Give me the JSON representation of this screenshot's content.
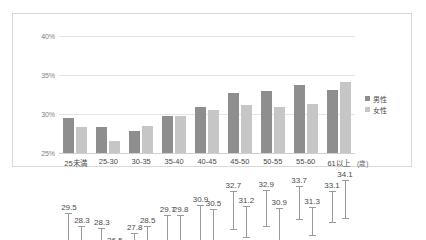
{
  "chart_data": {
    "type": "bar",
    "title": "",
    "subtitle": "",
    "xlabel": "(歳)",
    "ylabel": "",
    "ylim": [
      25,
      40
    ],
    "yticks": [
      40,
      35,
      30,
      25
    ],
    "ytick_labels": [
      "40%",
      "35%",
      "30%",
      "25%"
    ],
    "grid": true,
    "legend_position": "right",
    "categories": [
      "25未満",
      "25-30",
      "30-35",
      "35-40",
      "40-45",
      "45-50",
      "50-55",
      "55-60",
      "61以上"
    ],
    "series": [
      {
        "name": "男性",
        "color": "#8e8e8e",
        "values": [
          29.5,
          28.3,
          27.8,
          29.7,
          30.9,
          32.7,
          32.9,
          33.7,
          33.1
        ],
        "error_low": [
          26.7,
          26.2,
          25.9,
          27.3,
          28.4,
          30.3,
          30.6,
          31.6,
          31.1
        ],
        "error_high": [
          32.3,
          30.4,
          29.7,
          32.1,
          33.4,
          35.1,
          35.2,
          35.8,
          35.1
        ],
        "labels": [
          "29.5",
          "28.3",
          "27.8",
          "29.7",
          "30.9",
          "32.7",
          "32.9",
          "33.7",
          "33.1"
        ]
      },
      {
        "name": "女性",
        "color": "#c6c6c6",
        "values": [
          28.3,
          26.5,
          28.5,
          29.8,
          30.5,
          31.2,
          30.9,
          31.3,
          34.1
        ],
        "error_low": [
          26.0,
          24.9,
          26.4,
          27.6,
          28.2,
          29.2,
          28.9,
          29.5,
          31.7
        ],
        "error_high": [
          30.6,
          28.1,
          30.6,
          32.0,
          32.8,
          33.2,
          32.9,
          33.1,
          36.5
        ],
        "labels": [
          "28.3",
          "26.5",
          "28.5",
          "29.8",
          "30.5",
          "31.2",
          "30.9",
          "31.3",
          "34.1"
        ]
      }
    ]
  }
}
